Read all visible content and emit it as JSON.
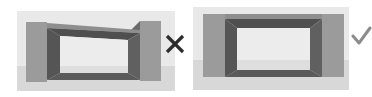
{
  "figure": {
    "panels": [
      {
        "id": "wrong",
        "verdict": "incorrect",
        "icon": "cross-icon",
        "symbol": "✕"
      },
      {
        "id": "right",
        "verdict": "correct",
        "icon": "check-icon",
        "symbol": "✓"
      }
    ]
  },
  "colors": {
    "background_top": "#e9e9e9",
    "background_bottom": "#d8d8d8",
    "pillar": "#9b9b9b",
    "frame_dark": "#565656",
    "frame_mid": "#6a6a6a",
    "opening": "#ececec",
    "opening_bottom": "#dedede",
    "cross": "#2b2b2b",
    "check": "#8c8c8c"
  }
}
